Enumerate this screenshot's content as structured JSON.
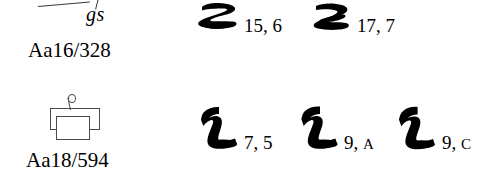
{
  "page": {
    "background": "#ffffff",
    "ink": "#000000",
    "sign_outline": "#4a4a4a"
  },
  "entries": [
    {
      "sign_icon": "hieroglyph-aa16",
      "transliteration": "gs",
      "sign_code": "Aa16/328",
      "variants": [
        {
          "glyph_icon": "hieratic-glyph-z-flat",
          "reference": "15, 6"
        },
        {
          "glyph_icon": "hieratic-glyph-z-angular",
          "reference": "17, 7"
        }
      ]
    },
    {
      "sign_icon": "hieroglyph-aa18",
      "transliteration": "",
      "sign_code": "Aa18/594",
      "variants": [
        {
          "glyph_icon": "hieratic-glyph-hooked-l",
          "reference": "7, 5",
          "ref_number": "7,",
          "ref_suffix": "5"
        },
        {
          "glyph_icon": "hieratic-glyph-hooked-l",
          "reference": "9, A",
          "ref_number": "9,",
          "ref_suffix": "A"
        },
        {
          "glyph_icon": "hieratic-glyph-hooked-l",
          "reference": "9, C",
          "ref_number": "9,",
          "ref_suffix": "C"
        }
      ]
    }
  ]
}
